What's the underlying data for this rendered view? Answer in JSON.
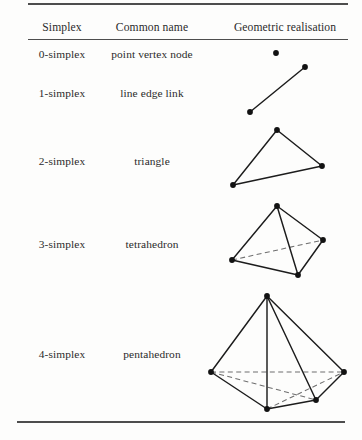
{
  "table": {
    "headers": [
      {
        "label": "Simplex",
        "name": "column-header-simplex"
      },
      {
        "label": "Common name",
        "name": "column-header-common-name"
      },
      {
        "label": "Geometric realisation",
        "name": "column-header-geometric-realisation"
      }
    ],
    "rows": [
      {
        "simplex": "0-simplex",
        "common_name": "point vertex node",
        "figure": "point"
      },
      {
        "simplex": "1-simplex",
        "common_name": "line edge link",
        "figure": "line-segment"
      },
      {
        "simplex": "2-simplex",
        "common_name": "triangle",
        "figure": "triangle"
      },
      {
        "simplex": "3-simplex",
        "common_name": "tetrahedron",
        "figure": "tetrahedron"
      },
      {
        "simplex": "4-simplex",
        "common_name": "pentahedron",
        "figure": "pentahedron"
      }
    ]
  },
  "style": {
    "page_background": "#fdfdfc",
    "text_color": "#2b2b2b",
    "rule_color": "#4d4d4d",
    "edge_color": "#1c1c1c",
    "hidden_edge_color": "#6e6e6e",
    "vertex_color": "#121212"
  },
  "figures": {
    "point": {
      "vertices": [
        [
          276,
          53
        ]
      ],
      "edges": [],
      "hidden_edges": []
    },
    "line-segment": {
      "vertices": [
        [
          250,
          112
        ],
        [
          305,
          67
        ]
      ],
      "edges": [
        [
          [
            250,
            112
          ],
          [
            305,
            67
          ]
        ]
      ],
      "hidden_edges": []
    },
    "triangle": {
      "vertices": [
        [
          277,
          130
        ],
        [
          322,
          166
        ],
        [
          233,
          185
        ]
      ],
      "edges": [
        [
          [
            277,
            130
          ],
          [
            322,
            166
          ]
        ],
        [
          [
            322,
            166
          ],
          [
            233,
            185
          ]
        ],
        [
          [
            233,
            185
          ],
          [
            277,
            130
          ]
        ]
      ],
      "hidden_edges": []
    },
    "tetrahedron": {
      "vertices": [
        [
          277,
          206
        ],
        [
          323,
          240
        ],
        [
          232,
          260
        ],
        [
          298,
          275
        ]
      ],
      "edges": [
        [
          [
            277,
            206
          ],
          [
            323,
            240
          ]
        ],
        [
          [
            277,
            206
          ],
          [
            232,
            260
          ]
        ],
        [
          [
            277,
            206
          ],
          [
            298,
            275
          ]
        ],
        [
          [
            323,
            240
          ],
          [
            298,
            275
          ]
        ],
        [
          [
            232,
            260
          ],
          [
            298,
            275
          ]
        ]
      ],
      "hidden_edges": [
        [
          [
            232,
            260
          ],
          [
            323,
            240
          ]
        ]
      ]
    },
    "pentahedron": {
      "vertices": [
        [
          267,
          296
        ],
        [
          211,
          372
        ],
        [
          344,
          372
        ],
        [
          267,
          409
        ],
        [
          316,
          400
        ]
      ],
      "edges": [
        [
          [
            267,
            296
          ],
          [
            211,
            372
          ]
        ],
        [
          [
            267,
            296
          ],
          [
            344,
            372
          ]
        ],
        [
          [
            267,
            296
          ],
          [
            267,
            409
          ]
        ],
        [
          [
            267,
            296
          ],
          [
            316,
            400
          ]
        ],
        [
          [
            211,
            372
          ],
          [
            267,
            409
          ]
        ],
        [
          [
            267,
            409
          ],
          [
            316,
            400
          ]
        ],
        [
          [
            316,
            400
          ],
          [
            344,
            372
          ]
        ]
      ],
      "hidden_edges": [
        [
          [
            211,
            372
          ],
          [
            344,
            372
          ]
        ],
        [
          [
            211,
            372
          ],
          [
            316,
            400
          ]
        ],
        [
          [
            267,
            409
          ],
          [
            344,
            372
          ]
        ]
      ]
    }
  }
}
